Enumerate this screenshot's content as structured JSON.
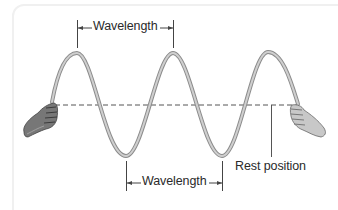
{
  "diagram": {
    "labels": {
      "wavelength_top": "Wavelength",
      "wavelength_bottom": "Wavelength",
      "rest_position": "Rest position"
    },
    "colors": {
      "rope": "#b8b8b8",
      "rope_edge": "#8c8c8c",
      "rest_line": "#555555",
      "bracket": "#444444",
      "text": "#2a2a2a",
      "hand": "#6a6a6a",
      "panel_border": "#f0f0f0"
    },
    "geometry": {
      "rest_y": 105,
      "crests_x": [
        77,
        173,
        268
      ],
      "troughs_x": [
        126,
        222
      ],
      "crest_y": 53,
      "trough_y": 156
    },
    "icons": {
      "left_hand": "hand-holding-rope-icon",
      "right_hand": "hand-holding-rope-icon"
    }
  }
}
